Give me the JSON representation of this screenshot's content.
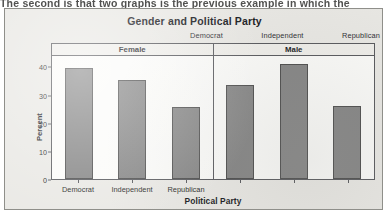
{
  "page": {
    "clipped_top_text": "The second is that two graphs is the previous example in which the"
  },
  "figure": {
    "title": "Gender and Political Party",
    "panels": [
      {
        "label": "Female"
      },
      {
        "label": "Male"
      }
    ],
    "top_category_labels": [
      "Democrat",
      "Independent",
      "Republican"
    ],
    "x_axis_title": "Political Party",
    "y_axis_title": "Percent",
    "y_ticks": [
      "0",
      "10",
      "20",
      "30",
      "40"
    ],
    "x_tick_labels": [
      "Democrat",
      "Independent",
      "Republican"
    ],
    "colors": {
      "bar_fill": "#838383",
      "bar_stroke": "#4a4a4a",
      "frame": "#55565a",
      "plot_background": "#fbfbf9",
      "figure_background": "#e9e8e4"
    }
  },
  "chart_data": {
    "type": "bar",
    "title": "Gender and Political Party",
    "xlabel": "Political Party",
    "ylabel": "Percent",
    "ylim": [
      0,
      44
    ],
    "yticks": [
      0,
      10,
      20,
      30,
      40
    ],
    "grid": false,
    "legend": "none",
    "panel_variable": "Gender",
    "categories": [
      "Democrat",
      "Independent",
      "Republican"
    ],
    "panels": [
      {
        "name": "Female",
        "values": [
          39.5,
          35.3,
          25.4
        ]
      },
      {
        "name": "Male",
        "values": [
          33.4,
          41.0,
          25.9
        ]
      }
    ],
    "series": [
      {
        "name": "Female",
        "values": [
          39.5,
          35.3,
          25.4
        ]
      },
      {
        "name": "Male",
        "values": [
          33.4,
          41.0,
          25.9
        ]
      }
    ]
  }
}
